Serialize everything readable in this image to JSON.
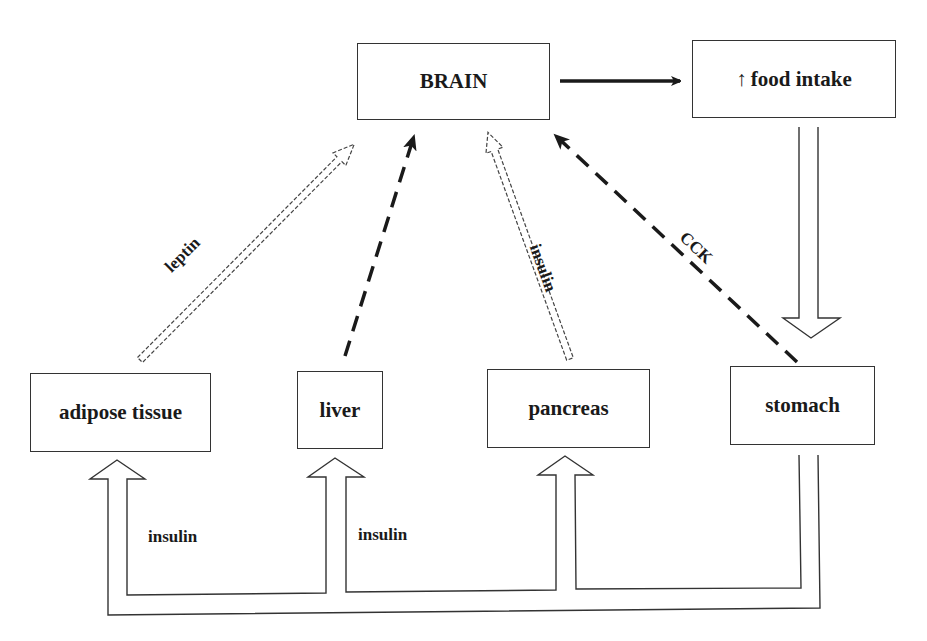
{
  "diagram": {
    "title": "",
    "nodes": {
      "brain": {
        "label": "BRAIN"
      },
      "food_intake": {
        "arrow_symbol": "↑",
        "label": "food intake"
      },
      "adipose": {
        "label": "adipose tissue"
      },
      "liver": {
        "label": "liver"
      },
      "pancreas": {
        "label": "pancreas"
      },
      "stomach": {
        "label": "stomach"
      }
    },
    "edges": [
      {
        "from": "brain",
        "to": "food_intake",
        "style": "solid-arrow",
        "label": ""
      },
      {
        "from": "food_intake",
        "to": "stomach",
        "style": "hollow-block-arrow",
        "label": ""
      },
      {
        "from": "adipose",
        "to": "brain",
        "style": "hollow-dashed-arrow",
        "label": "leptin"
      },
      {
        "from": "liver",
        "to": "brain",
        "style": "dashed-arrow",
        "label": ""
      },
      {
        "from": "pancreas",
        "to": "brain",
        "style": "hollow-dashed-arrow",
        "label": "insulin"
      },
      {
        "from": "stomach",
        "to": "brain",
        "style": "dashed-arrow",
        "label": "CCK"
      },
      {
        "from": "stomach",
        "to": "adipose",
        "style": "hollow-pipe-arrow",
        "label": "insulin"
      },
      {
        "from": "stomach",
        "to": "liver",
        "style": "hollow-pipe-arrow",
        "label": "insulin"
      },
      {
        "from": "stomach",
        "to": "pancreas",
        "style": "hollow-pipe-arrow",
        "label": ""
      }
    ],
    "labels": {
      "leptin": "leptin",
      "pancreas_insulin": "insulin",
      "cck": "CCK",
      "adipose_insulin": "insulin",
      "liver_insulin": "insulin"
    },
    "colors": {
      "stroke": "#1a1a1a",
      "background": "#ffffff"
    }
  }
}
